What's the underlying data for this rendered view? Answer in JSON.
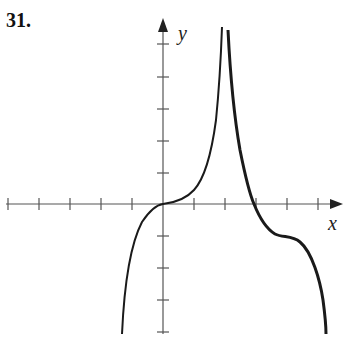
{
  "problem": {
    "number": "31."
  },
  "axes": {
    "x_label": "x",
    "y_label": "y",
    "x_ticks_px": [
      8,
      39,
      70,
      101,
      132,
      194,
      225,
      256,
      287,
      318
    ],
    "y_ticks_px": [
      44,
      77,
      109,
      141,
      173,
      236,
      268,
      300,
      332
    ],
    "origin_px": [
      163,
      204
    ]
  },
  "curves": {
    "left_branch": "M122,334 C124,290 130,245 142,222 C150,210 156,205 163,204 C172,203 185,200 194,190 C205,178 212,150 216,120 C219,90 221,55 222,27",
    "right_branch": "M228,30 C230,70 233,110 240,150 C245,175 250,195 254,204 C258,214 265,228 275,234 C283,238 292,235 300,242 C312,252 320,280 323,300 C325,315 326,325 326,334"
  },
  "colors": {
    "ink": "#1a1a1a",
    "axis": "#555555"
  },
  "chart_data": {
    "type": "line",
    "title": "31.",
    "xlabel": "x",
    "ylabel": "y",
    "grid": false,
    "x_ticks": [
      -5,
      -4,
      -3,
      -2,
      -1,
      1,
      2,
      3,
      4,
      5
    ],
    "y_ticks": [
      5,
      4,
      3,
      2,
      1,
      -1,
      -2,
      -3,
      -4
    ],
    "vertical_asymptote_x": 2,
    "key_points": [
      {
        "x": 0,
        "y": 0,
        "note": "inflection, horizontal tangent"
      },
      {
        "x": 3,
        "y": 0,
        "note": "x-intercept"
      },
      {
        "x": 4,
        "y": -1,
        "note": "inflection, horizontal tangent"
      }
    ]
  }
}
